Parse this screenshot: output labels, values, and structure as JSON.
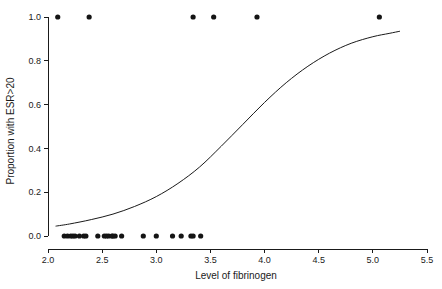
{
  "chart_data": {
    "type": "scatter",
    "title": "",
    "subtitle": "",
    "xlabel": "Level of fibrinogen",
    "ylabel": "Proportion with ESR>20",
    "xlim": [
      2.0,
      5.5
    ],
    "ylim": [
      0.0,
      1.0
    ],
    "xticks": [
      2.0,
      2.5,
      3.0,
      3.5,
      4.0,
      4.5,
      5.0,
      5.5
    ],
    "xtick_labels": [
      "2.0",
      "2.5",
      "3.0",
      "3.5",
      "4.0",
      "4.5",
      "5.0",
      "5.5"
    ],
    "yticks": [
      0.0,
      0.2,
      0.4,
      0.6,
      0.8,
      1.0
    ],
    "ytick_labels": [
      "0.0",
      "0.2",
      "0.4",
      "0.6",
      "0.8",
      "1.0"
    ],
    "grid": false,
    "legend": "none",
    "point_color": "#141414",
    "line_color": "#1a1a1a",
    "background_color": "#ffffff",
    "series": [
      {
        "name": "Observed ESR>20 (outcome = 1)",
        "marker": "filled-circle",
        "x": [
          2.09,
          2.38,
          3.34,
          3.53,
          3.93,
          5.06
        ],
        "y": [
          1.0,
          1.0,
          1.0,
          1.0,
          1.0,
          1.0
        ]
      },
      {
        "name": "Observed ESR<=20 (outcome = 0)",
        "marker": "filled-circle",
        "x": [
          2.15,
          2.18,
          2.21,
          2.23,
          2.25,
          2.29,
          2.33,
          2.35,
          2.46,
          2.52,
          2.54,
          2.56,
          2.59,
          2.6,
          2.62,
          2.68,
          2.88,
          3.0,
          3.15,
          3.23,
          3.32,
          3.34,
          3.41
        ],
        "y": [
          0.0,
          0.0,
          0.0,
          0.0,
          0.0,
          0.0,
          0.0,
          0.0,
          0.0,
          0.0,
          0.0,
          0.0,
          0.0,
          0.0,
          0.0,
          0.0,
          0.0,
          0.0,
          0.0,
          0.0,
          0.0,
          0.0,
          0.0
        ]
      },
      {
        "name": "Fitted logistic curve",
        "marker": "line",
        "x": [
          2.07,
          2.2,
          2.4,
          2.6,
          2.8,
          3.0,
          3.2,
          3.4,
          3.6,
          3.8,
          4.0,
          4.2,
          4.4,
          4.6,
          4.8,
          5.0,
          5.15,
          5.25
        ],
        "y": [
          0.045,
          0.055,
          0.075,
          0.1,
          0.135,
          0.18,
          0.24,
          0.315,
          0.41,
          0.51,
          0.61,
          0.7,
          0.775,
          0.835,
          0.88,
          0.91,
          0.925,
          0.935
        ]
      }
    ]
  },
  "axes": {
    "x_axis_name": "x-axis",
    "y_axis_name": "y-axis"
  }
}
